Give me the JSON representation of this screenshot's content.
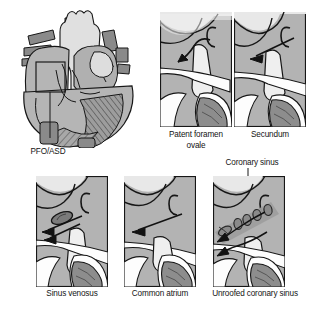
{
  "figure": {
    "background_color": "#ffffff",
    "ink_color": "#141414",
    "palette": {
      "chamber_fill": "#b3b3b3",
      "pale_fill": "#e4e4e4",
      "light_fill": "#f1f1f1",
      "mid_gray": "#9a9a9a",
      "dark_gray": "#7d7d7d",
      "vessel_dark": "#8a8a8a",
      "band_gray": "#a0a0a0",
      "hatch_gray": "#8f8f8f",
      "outline": "#161616"
    }
  },
  "overview": {
    "name": "whole-heart-diagram",
    "label": "PFO/ASD",
    "callout_box": {
      "x": 36,
      "y": 62,
      "width": 29,
      "height": 30
    },
    "leader_line": {
      "x1": 50,
      "y1": 92,
      "x2": 50,
      "y2": 138
    }
  },
  "panels": [
    {
      "id": "patent-foramen-ovale",
      "caption": "Patent foramen\novale",
      "caption_lines": [
        "Patent foramen",
        "ovale"
      ],
      "row": "top",
      "frame": {
        "x": 160,
        "y": 12,
        "width": 72,
        "height": 115
      },
      "arrow_style": "curved-tunnel-arrow",
      "arrow_direction": "left-downward",
      "defect_marks": 0
    },
    {
      "id": "secundum",
      "caption": "Secundum",
      "caption_lines": [
        "Secundum"
      ],
      "row": "top",
      "frame": {
        "x": 234,
        "y": 12,
        "width": 72,
        "height": 115
      },
      "arrow_style": "straight-arrow",
      "arrow_direction": "left-downward",
      "defect_marks": 0
    },
    {
      "id": "sinus-venosus",
      "caption": "Sinus venosus",
      "caption_lines": [
        "Sinus venosus"
      ],
      "row": "bottom",
      "frame": {
        "x": 36,
        "y": 176,
        "width": 72,
        "height": 111
      },
      "arrow_style": "double-straight-arrow",
      "arrow_direction": "left",
      "defect_marks": 1
    },
    {
      "id": "common-atrium",
      "caption": "Common atrium",
      "caption_lines": [
        "Common atrium"
      ],
      "row": "bottom",
      "frame": {
        "x": 124,
        "y": 176,
        "width": 72,
        "height": 111
      },
      "arrow_style": "long-straight-arrow",
      "arrow_direction": "left",
      "defect_marks": 0
    },
    {
      "id": "unroofed-coronary-sinus",
      "caption": "Unroofed coronary sinus",
      "caption_lines": [
        "Unroofed coronary sinus"
      ],
      "row": "bottom",
      "frame": {
        "x": 213,
        "y": 176,
        "width": 72,
        "height": 111
      },
      "arrow_style": "double-curved-arrow",
      "arrow_direction": "left-downward",
      "defect_marks": 5,
      "annotation": {
        "label": "Coronary sinus",
        "leader_from": {
          "x": 248,
          "y": 172
        },
        "leader_to": {
          "x": 232,
          "y": 212
        }
      }
    }
  ]
}
